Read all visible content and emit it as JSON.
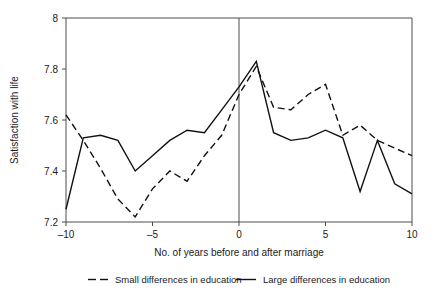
{
  "chart_data": {
    "type": "line",
    "title": "",
    "xlabel": "No. of years before and after marriage",
    "ylabel": "Satisfaction with life",
    "xlim": [
      -10,
      10
    ],
    "ylim": [
      7.2,
      8
    ],
    "xticks": [
      -10,
      -5,
      0,
      5,
      10
    ],
    "xticklabels": [
      "–10",
      "–5",
      "0",
      "5",
      "10"
    ],
    "yticks": [
      7.2,
      7.4,
      7.6,
      7.8,
      8
    ],
    "yticklabels": [
      "7.2",
      "7.4",
      "7.6",
      "7.8",
      "8"
    ],
    "grid": false,
    "legend_position": "below",
    "annotations": [
      {
        "name": "marriage-reference-line",
        "type": "vline",
        "x": 0
      }
    ],
    "x": [
      -10,
      -9,
      -8,
      -7,
      -6,
      -5,
      -4,
      -3,
      -2,
      -1,
      0,
      1,
      2,
      3,
      4,
      5,
      6,
      7,
      8,
      9,
      10
    ],
    "series": [
      {
        "name": "Small differences in education",
        "style": "dashed",
        "values": [
          7.62,
          7.52,
          7.41,
          7.29,
          7.22,
          7.33,
          7.4,
          7.36,
          7.46,
          7.54,
          7.7,
          7.81,
          7.65,
          7.64,
          7.7,
          7.74,
          7.54,
          7.58,
          7.52,
          7.49,
          7.46
        ]
      },
      {
        "name": "Large differences in education",
        "style": "solid",
        "values": [
          7.25,
          7.53,
          7.54,
          7.52,
          7.4,
          7.46,
          7.52,
          7.56,
          7.55,
          7.64,
          7.73,
          7.83,
          7.55,
          7.52,
          7.53,
          7.56,
          7.53,
          7.32,
          7.52,
          7.35,
          7.31
        ]
      }
    ],
    "legend": [
      {
        "label": "Small differences in education",
        "style": "dashed"
      },
      {
        "label": "Large differences in education",
        "style": "solid"
      }
    ]
  }
}
